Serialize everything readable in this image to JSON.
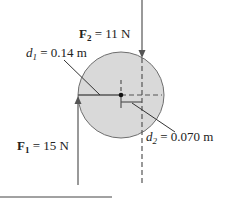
{
  "diagram": {
    "type": "torque-free-body",
    "colors": {
      "disk_fill": "#d9d9d9",
      "disk_stroke": "#6e6e6e",
      "line": "#555555",
      "text": "#222222"
    },
    "forces": [
      {
        "symbol": "F",
        "subscript": "2",
        "equals": " = ",
        "value": "11 N",
        "direction": "down"
      },
      {
        "symbol": "F",
        "subscript": "1",
        "equals": " = ",
        "value": "15 N",
        "direction": "up"
      }
    ],
    "distances": [
      {
        "symbol": "d",
        "subscript": "1",
        "equals": " = ",
        "value": "0.14 m"
      },
      {
        "symbol": "d",
        "subscript": "2",
        "equals": " = ",
        "value": "0.070 m"
      }
    ]
  }
}
